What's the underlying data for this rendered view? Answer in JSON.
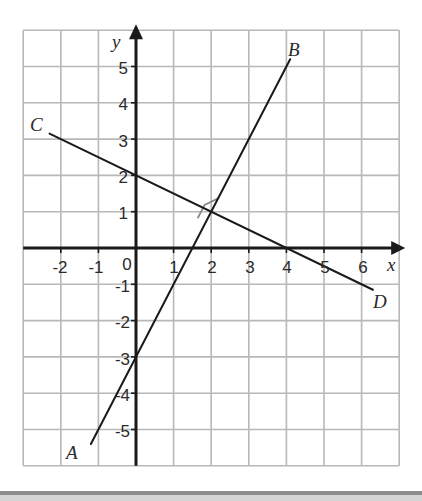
{
  "diagram": {
    "type": "coordinate-plane",
    "axes": {
      "x_label": "x",
      "y_label": "y",
      "x_range": [
        -3,
        7
      ],
      "y_range": [
        -6,
        6
      ],
      "x_ticks": [
        "-2",
        "-1",
        "0",
        "1",
        "2",
        "3",
        "4",
        "5",
        "6"
      ],
      "y_ticks": [
        "5",
        "4",
        "3",
        "2",
        "1",
        "-1",
        "-2",
        "-3",
        "-4",
        "-5"
      ],
      "grid": true
    },
    "lines": [
      {
        "name": "AB",
        "from_label": "A",
        "to_label": "B",
        "equation": "y = 2x - 3",
        "start": [
          -1.2,
          -5.4
        ],
        "end": [
          4.1,
          5.2
        ]
      },
      {
        "name": "CD",
        "from_label": "C",
        "to_label": "D",
        "equation": "y = -0.5x + 2",
        "start": [
          -2.3,
          3.15
        ],
        "end": [
          6.3,
          -1.15
        ]
      }
    ],
    "intersection": {
      "point": [
        2,
        1
      ],
      "right_angle_marker": true
    },
    "labels": {
      "A": "A",
      "B": "B",
      "C": "C",
      "D": "D"
    },
    "colors": {
      "grid": "#b8b8b8",
      "axes": "#1a1a1a",
      "lines": "#1a1a1a",
      "right_angle": "#8a8a8a"
    }
  }
}
